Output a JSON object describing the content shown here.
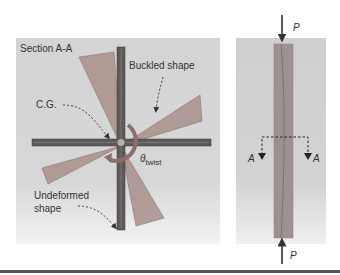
{
  "left_panel": {
    "title": "Section A-A",
    "labels": {
      "buckled": "Buckled shape",
      "cg": "C.G.",
      "theta": "θ",
      "theta_sub": "twist",
      "undeformed_line1": "Undeformed",
      "undeformed_line2": "shape"
    }
  },
  "right_panel": {
    "load_top": "P",
    "load_bottom": "P",
    "section_left": "A",
    "section_right": "A"
  },
  "colors": {
    "panel_bg": "#d5d5d5",
    "buckled_fill": "#a88f8a",
    "undeformed_fill": "#5e5a59",
    "column_fill": "#9c9292",
    "arrow": "#333333"
  }
}
